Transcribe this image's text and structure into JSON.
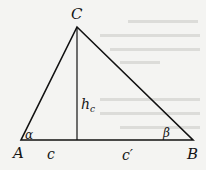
{
  "diagram": {
    "type": "triangle-with-altitude",
    "vertices": {
      "A": {
        "label": "A",
        "x": 21,
        "y": 140
      },
      "B": {
        "label": "B",
        "x": 193,
        "y": 140
      },
      "C": {
        "label": "C",
        "x": 77,
        "y": 27
      }
    },
    "altitude": {
      "label_main": "h",
      "label_sub": "c",
      "foot": {
        "x": 77,
        "y": 140
      }
    },
    "segments": {
      "left": "c",
      "right": "c′"
    },
    "angles": {
      "at_A": "α",
      "at_B": "β"
    },
    "colors": {
      "stroke": "#111111",
      "background": "#f4f4f2",
      "bleed_text": "#d9d9d6"
    }
  }
}
